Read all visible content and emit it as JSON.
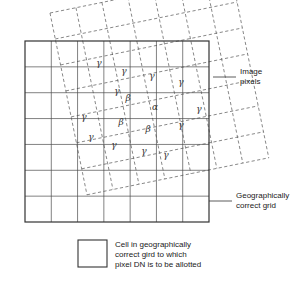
{
  "figure": {
    "annotations": {
      "image_pixels": {
        "line1": "Image",
        "line2": "pixels"
      },
      "correct_grid": {
        "line1": "Geographically",
        "line2": "correct grid"
      }
    },
    "legend": {
      "swatch_name": "grid-cell-swatch",
      "line1": "Cell in geographically",
      "line2": "correct gird to which",
      "line3": "pixel DN is to be allotted"
    },
    "colors": {
      "solid_grid": "#4a4a4a",
      "solid_grid_outer": "#333333",
      "dashed_grid": "#555555",
      "text": "#1a1a1a",
      "background": "#ffffff"
    },
    "solid_grid": {
      "name": "geographically-correct-grid",
      "cols": 7,
      "rows": 7,
      "x": 25,
      "y": 41,
      "width": 184,
      "height": 181
    },
    "dashed_grid": {
      "name": "image-pixel-grid",
      "cols": 7,
      "rows": 7,
      "rotation_deg": -11.5,
      "origin_x": 50,
      "origin_y": 13,
      "cell_w": 26.5,
      "cell_h": 26.5
    },
    "greek_labels": [
      {
        "symbol": "γ",
        "x": 99,
        "y": 66
      },
      {
        "symbol": "γ",
        "x": 124,
        "y": 74
      },
      {
        "symbol": "γ",
        "x": 152,
        "y": 79
      },
      {
        "symbol": "γ",
        "x": 181,
        "y": 85
      },
      {
        "symbol": "γ",
        "x": 117,
        "y": 94
      },
      {
        "symbol": "β",
        "x": 128,
        "y": 101
      },
      {
        "symbol": "α",
        "x": 155,
        "y": 110
      },
      {
        "symbol": "γ",
        "x": 199,
        "y": 112
      },
      {
        "symbol": "γ",
        "x": 84,
        "y": 120
      },
      {
        "symbol": "β",
        "x": 121,
        "y": 125
      },
      {
        "symbol": "β",
        "x": 148,
        "y": 132
      },
      {
        "symbol": "γ",
        "x": 181,
        "y": 128
      },
      {
        "symbol": "γ",
        "x": 91,
        "y": 140
      },
      {
        "symbol": "γ",
        "x": 114,
        "y": 148
      },
      {
        "symbol": "γ",
        "x": 144,
        "y": 154
      },
      {
        "symbol": "γ",
        "x": 166,
        "y": 158
      }
    ]
  },
  "chart_data": {
    "type": "diagram",
    "symbols": [
      {
        "symbol": "α",
        "count": 1
      },
      {
        "symbol": "β",
        "count": 3
      },
      {
        "symbol": "γ",
        "count": 12
      }
    ],
    "grids": [
      {
        "name": "geographically correct grid",
        "style": "solid",
        "cols": 7,
        "rows": 7,
        "rotation_deg": 0
      },
      {
        "name": "image pixels",
        "style": "dashed",
        "cols": 7,
        "rows": 7,
        "rotation_deg": -11.5
      }
    ]
  }
}
